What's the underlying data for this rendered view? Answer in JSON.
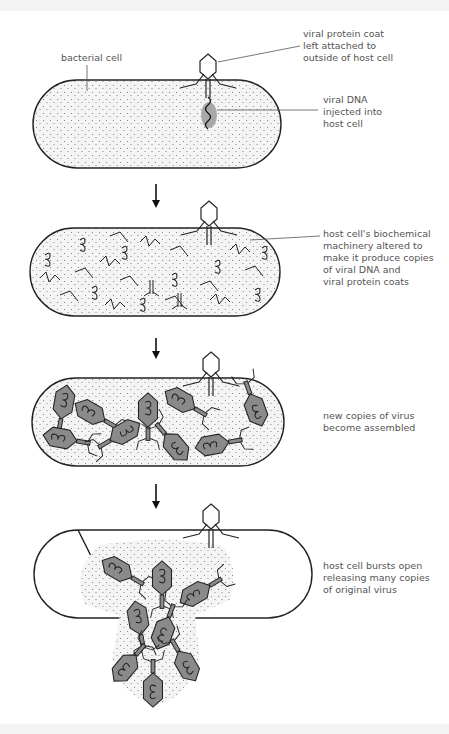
{
  "diagram": {
    "stages": [
      {
        "id": "stage-1-injection",
        "labels": [
          {
            "name": "bacterial-cell-label",
            "text": "bacterial cell"
          },
          {
            "name": "viral-protein-coat-label",
            "text": "viral protein coat\nleft attached to\noutside of host cell"
          },
          {
            "name": "viral-dna-label",
            "text": "viral DNA\ninjected into\nhost cell"
          }
        ]
      },
      {
        "id": "stage-2-replication",
        "labels": [
          {
            "name": "machinery-altered-label",
            "text": "host cell's biochemical\nmachinery altered to\nmake it produce copies\nof viral DNA and\nviral protein coats"
          }
        ]
      },
      {
        "id": "stage-3-assembly",
        "labels": [
          {
            "name": "assembly-label",
            "text": "new copies of virus\nbecome assembled"
          }
        ]
      },
      {
        "id": "stage-4-lysis",
        "labels": [
          {
            "name": "burst-label",
            "text": "host cell bursts open\nreleasing many copies\nof original virus"
          }
        ]
      }
    ],
    "colors": {
      "outline": "#222222",
      "cell_fill": "#f2f2f2",
      "virus_fill": "#8a8a8a",
      "dna_patch": "#a8a8a8",
      "label_text": "#555555"
    }
  }
}
